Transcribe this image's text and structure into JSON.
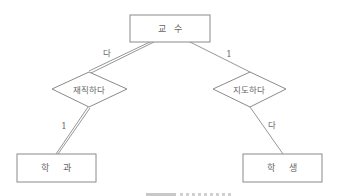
{
  "diagram": {
    "type": "ER diagram",
    "entities": [
      {
        "id": "professor",
        "label": "교   수"
      },
      {
        "id": "department",
        "label": "학     과"
      },
      {
        "id": "student",
        "label": "학     생"
      }
    ],
    "relationships": [
      {
        "id": "employed",
        "label": "재직하다",
        "from": "professor",
        "to": "department",
        "from_cardinality": "다",
        "to_cardinality": "1",
        "participation": "total (double line)"
      },
      {
        "id": "advise",
        "label": "지도하다",
        "from": "professor",
        "to": "student",
        "from_cardinality": "1",
        "to_cardinality": "다",
        "participation": "partial (single line)"
      }
    ],
    "cardinality_labels": {
      "prof_employed": "다",
      "employed_dept": "1",
      "prof_advise": "1",
      "advise_student": "다"
    },
    "colors": {
      "stroke": "#8a8a8a",
      "text": "#666666",
      "background": "#ffffff"
    }
  }
}
